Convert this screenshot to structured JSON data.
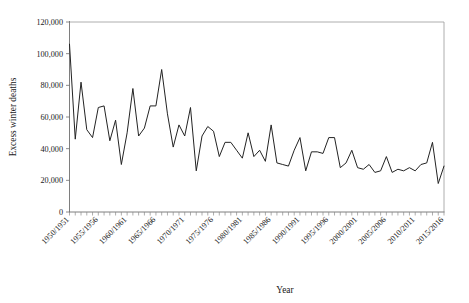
{
  "chart_data": {
    "type": "line",
    "title": "",
    "xlabel": "Year",
    "ylabel": "Excess winter deaths",
    "ylim": [
      0,
      120000
    ],
    "ytick_values": [
      0,
      20000,
      40000,
      60000,
      80000,
      100000,
      120000
    ],
    "ytick_labels": [
      "0",
      "20,000",
      "40,000",
      "60,000",
      "80,000",
      "100,000",
      "120,000"
    ],
    "grid": false,
    "legend": "none",
    "xtick_labels": [
      "1950/1951",
      "1955/1956",
      "1960/1961",
      "1965/1966",
      "1970/1971",
      "1975/1976",
      "1980/1981",
      "1985/1986",
      "1990/1991",
      "1995/1996",
      "2000/2001",
      "2005/2006",
      "2010/2011",
      "2015/2016"
    ],
    "xtick_indices": [
      0,
      5,
      10,
      15,
      20,
      25,
      30,
      35,
      40,
      45,
      50,
      55,
      60,
      65
    ],
    "categories": [
      "1950/1951",
      "1951/1952",
      "1952/1953",
      "1953/1954",
      "1954/1955",
      "1955/1956",
      "1956/1957",
      "1957/1958",
      "1958/1959",
      "1959/1960",
      "1960/1961",
      "1961/1962",
      "1962/1963",
      "1963/1964",
      "1964/1965",
      "1965/1966",
      "1966/1967",
      "1967/1968",
      "1968/1969",
      "1969/1970",
      "1970/1971",
      "1971/1972",
      "1972/1973",
      "1973/1974",
      "1974/1975",
      "1975/1976",
      "1976/1977",
      "1977/1978",
      "1978/1979",
      "1979/1980",
      "1980/1981",
      "1981/1982",
      "1982/1983",
      "1983/1984",
      "1984/1985",
      "1985/1986",
      "1986/1987",
      "1987/1988",
      "1988/1989",
      "1989/1990",
      "1990/1991",
      "1991/1992",
      "1992/1993",
      "1993/1994",
      "1994/1995",
      "1995/1996",
      "1996/1997",
      "1997/1998",
      "1998/1999",
      "1999/2000",
      "2000/2001",
      "2001/2002",
      "2002/2003",
      "2003/2004",
      "2004/2005",
      "2005/2006",
      "2006/2007",
      "2007/2008",
      "2008/2009",
      "2009/2010",
      "2010/2011",
      "2011/2012",
      "2012/2013",
      "2013/2014",
      "2014/2015",
      "2015/2016"
    ],
    "values": [
      106000,
      46000,
      82000,
      52000,
      47000,
      66000,
      67000,
      45000,
      58000,
      30000,
      50000,
      78000,
      48000,
      53000,
      67000,
      67000,
      90000,
      62000,
      41000,
      55000,
      48000,
      66000,
      26000,
      48000,
      54000,
      51000,
      35000,
      44000,
      44000,
      39000,
      34000,
      50000,
      35000,
      39000,
      32000,
      55000,
      31000,
      30000,
      29000,
      39000,
      47000,
      26000,
      38000,
      38000,
      37000,
      47000,
      47000,
      28000,
      31000,
      39000,
      28000,
      27000,
      30000,
      25000,
      26000,
      35000,
      25000,
      27000,
      26000,
      28000,
      26000,
      30000,
      31000,
      44000,
      18000,
      29000
    ]
  }
}
